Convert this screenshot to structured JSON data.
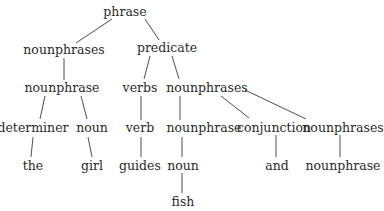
{
  "diagram": {
    "type": "parse-tree",
    "nodes": [
      {
        "id": "n0",
        "label": "phrase",
        "x": 125,
        "y": 12
      },
      {
        "id": "n1",
        "label": "nounphrases",
        "x": 64,
        "y": 50
      },
      {
        "id": "n2",
        "label": "predicate",
        "x": 167,
        "y": 48
      },
      {
        "id": "n3",
        "label": "nounphrase",
        "x": 62,
        "y": 88
      },
      {
        "id": "n4",
        "label": "verbs",
        "x": 140,
        "y": 88
      },
      {
        "id": "n5",
        "label": "nounphrases",
        "x": 207,
        "y": 88
      },
      {
        "id": "n6",
        "label": "determiner",
        "x": 33,
        "y": 128
      },
      {
        "id": "n7",
        "label": "noun",
        "x": 92,
        "y": 128
      },
      {
        "id": "n8",
        "label": "verb",
        "x": 140,
        "y": 128
      },
      {
        "id": "n9",
        "label": "nounphrase",
        "x": 204,
        "y": 128
      },
      {
        "id": "n10",
        "label": "conjunction",
        "x": 274,
        "y": 128
      },
      {
        "id": "n11",
        "label": "nounphrases",
        "x": 343,
        "y": 128
      },
      {
        "id": "n12",
        "label": "the",
        "x": 33,
        "y": 166
      },
      {
        "id": "n13",
        "label": "girl",
        "x": 92,
        "y": 166
      },
      {
        "id": "n14",
        "label": "guides",
        "x": 140,
        "y": 166
      },
      {
        "id": "n15",
        "label": "noun",
        "x": 183,
        "y": 166
      },
      {
        "id": "n16",
        "label": "and",
        "x": 277,
        "y": 166
      },
      {
        "id": "n17",
        "label": "nounphrase",
        "x": 343,
        "y": 166
      },
      {
        "id": "n18",
        "label": "fish",
        "x": 183,
        "y": 202
      }
    ],
    "edges": [
      {
        "from": "n0",
        "to": "n1",
        "x1": 112,
        "y1": 19,
        "x2": 76,
        "y2": 43
      },
      {
        "from": "n0",
        "to": "n2",
        "x1": 145,
        "y1": 19,
        "x2": 159,
        "y2": 40
      },
      {
        "from": "n1",
        "to": "n3",
        "x1": 64,
        "y1": 58,
        "x2": 64,
        "y2": 80
      },
      {
        "from": "n2",
        "to": "n4",
        "x1": 150,
        "y1": 56,
        "x2": 144,
        "y2": 79
      },
      {
        "from": "n2",
        "to": "n5",
        "x1": 172,
        "y1": 56,
        "x2": 179,
        "y2": 79
      },
      {
        "from": "n3",
        "to": "n6",
        "x1": 45,
        "y1": 96,
        "x2": 40,
        "y2": 119
      },
      {
        "from": "n3",
        "to": "n7",
        "x1": 81,
        "y1": 96,
        "x2": 87,
        "y2": 119
      },
      {
        "from": "n4",
        "to": "n8",
        "x1": 141,
        "y1": 96,
        "x2": 141,
        "y2": 120
      },
      {
        "from": "n5",
        "to": "n9",
        "x1": 180,
        "y1": 96,
        "x2": 180,
        "y2": 120
      },
      {
        "from": "n5",
        "to": "n10",
        "x1": 221,
        "y1": 96,
        "x2": 249,
        "y2": 118
      },
      {
        "from": "n5",
        "to": "n11",
        "x1": 245,
        "y1": 90,
        "x2": 306,
        "y2": 119
      },
      {
        "from": "n6",
        "to": "n12",
        "x1": 33,
        "y1": 137,
        "x2": 31,
        "y2": 157
      },
      {
        "from": "n7",
        "to": "n13",
        "x1": 88,
        "y1": 137,
        "x2": 92,
        "y2": 157
      },
      {
        "from": "n8",
        "to": "n14",
        "x1": 141,
        "y1": 137,
        "x2": 141,
        "y2": 157
      },
      {
        "from": "n9",
        "to": "n15",
        "x1": 182,
        "y1": 137,
        "x2": 182,
        "y2": 157
      },
      {
        "from": "n10",
        "to": "n16",
        "x1": 276,
        "y1": 135,
        "x2": 276,
        "y2": 157
      },
      {
        "from": "n11",
        "to": "n17",
        "x1": 340,
        "y1": 135,
        "x2": 340,
        "y2": 157
      },
      {
        "from": "n15",
        "to": "n18",
        "x1": 182,
        "y1": 173,
        "x2": 182,
        "y2": 193
      }
    ]
  }
}
